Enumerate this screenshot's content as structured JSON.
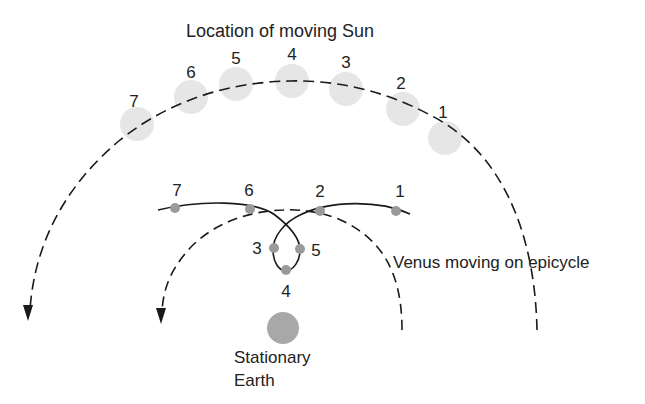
{
  "title": "Location of moving Sun",
  "venus_label": "Venus moving on epicycle",
  "earth_label": {
    "line1": "Stationary",
    "line2": "Earth"
  },
  "colors": {
    "sun": "#e6e6e6",
    "venus_dot": "#9a9a9a",
    "earth": "#a8a8a8",
    "line": "#1a1a1a",
    "text": "#222222"
  },
  "sun_positions": [
    {
      "label": "1",
      "cx": 445,
      "cy": 138,
      "lx": 443,
      "ly": 118
    },
    {
      "label": "2",
      "cx": 403,
      "cy": 109,
      "lx": 401,
      "ly": 89
    },
    {
      "label": "3",
      "cx": 346,
      "cy": 89,
      "lx": 346,
      "ly": 68
    },
    {
      "label": "4",
      "cx": 292,
      "cy": 81,
      "lx": 292,
      "ly": 60
    },
    {
      "label": "5",
      "cx": 236,
      "cy": 84,
      "lx": 236,
      "ly": 64
    },
    {
      "label": "6",
      "cx": 191,
      "cy": 97,
      "lx": 191,
      "ly": 78
    },
    {
      "label": "7",
      "cx": 137,
      "cy": 124,
      "lx": 134,
      "ly": 107
    }
  ],
  "venus_positions": [
    {
      "label": "1",
      "cx": 396,
      "cy": 211,
      "lx": 400,
      "ly": 197
    },
    {
      "label": "2",
      "cx": 320,
      "cy": 211,
      "lx": 320,
      "ly": 197
    },
    {
      "label": "3",
      "cx": 274,
      "cy": 248,
      "lx": 257,
      "ly": 254
    },
    {
      "label": "4",
      "cx": 286,
      "cy": 270,
      "lx": 286,
      "ly": 297
    },
    {
      "label": "5",
      "cx": 300,
      "cy": 249,
      "lx": 316,
      "ly": 256
    },
    {
      "label": "6",
      "cx": 250,
      "cy": 209,
      "lx": 249,
      "ly": 196
    },
    {
      "label": "7",
      "cx": 175,
      "cy": 208,
      "lx": 177,
      "ly": 196
    }
  ]
}
